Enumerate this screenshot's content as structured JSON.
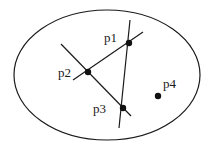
{
  "diagram": {
    "region": {
      "shape": "ellipse",
      "cx": 107,
      "cy": 75,
      "rx": 93,
      "ry": 65
    },
    "points": [
      {
        "id": "p1",
        "label": "p1",
        "x": 129,
        "y": 43,
        "label_x": 104,
        "label_y": 42
      },
      {
        "id": "p2",
        "label": "p2",
        "x": 88,
        "y": 72,
        "label_x": 58,
        "label_y": 77
      },
      {
        "id": "p3",
        "label": "p3",
        "x": 123,
        "y": 108,
        "label_x": 93,
        "label_y": 113
      },
      {
        "id": "p4",
        "label": "p4",
        "x": 158,
        "y": 96,
        "label_x": 163,
        "label_y": 88
      }
    ],
    "lines": [
      {
        "id": "line-p2-p1",
        "through": [
          "p2",
          "p1"
        ],
        "x1": 73,
        "y1": 80,
        "x2": 143,
        "y2": 32
      },
      {
        "id": "line-p2-p3",
        "through": [
          "p2",
          "p3"
        ],
        "x1": 61,
        "y1": 44,
        "x2": 131,
        "y2": 116
      },
      {
        "id": "line-p1-p3",
        "through": [
          "p1",
          "p3"
        ],
        "x1": 130,
        "y1": 20,
        "x2": 119,
        "y2": 128
      }
    ],
    "colors": {
      "stroke": "#1a1a1a",
      "point": "#111111",
      "background": "#ffffff"
    }
  }
}
